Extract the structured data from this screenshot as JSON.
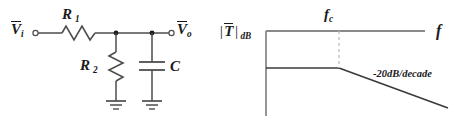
{
  "figure": {
    "title_circuit": "RC low-pass filter",
    "title_plot": "Bode magnitude response"
  },
  "circuit": {
    "input_label": {
      "symbol": "V",
      "overbar": true,
      "subscript": "i"
    },
    "output_label": {
      "symbol": "V",
      "overbar": true,
      "subscript": "o"
    },
    "components": [
      {
        "name": "resistor-r1",
        "label": "R",
        "subscript": "1",
        "orientation": "horizontal"
      },
      {
        "name": "resistor-r2",
        "label": "R",
        "subscript": "2",
        "orientation": "vertical"
      },
      {
        "name": "capacitor-c",
        "label": "C",
        "subscript": "",
        "orientation": "vertical"
      }
    ],
    "ground_count": 2,
    "terminal_count": 2,
    "node_count": 2
  },
  "plot": {
    "y_axis_label": {
      "symbol": "T",
      "overbar": true,
      "bars": "|",
      "subscript": "dB"
    },
    "x_axis_label": "f",
    "corner_frequency_label": {
      "symbol": "f",
      "subscript": "c"
    },
    "slope_annotation": "-20dB/decade",
    "asymptotes": [
      {
        "name": "passband-flat",
        "slope_db_per_decade": 0
      },
      {
        "name": "stopband-rolloff",
        "slope_db_per_decade": -20
      }
    ],
    "guide_line": "dashed-vertical-at-fc"
  },
  "colors": {
    "ink": "#1a1a1a",
    "wire": "#4d4d4d",
    "axis": "#8a8a8a",
    "dashed": "#bdbdbd",
    "background": "#ffffff"
  }
}
